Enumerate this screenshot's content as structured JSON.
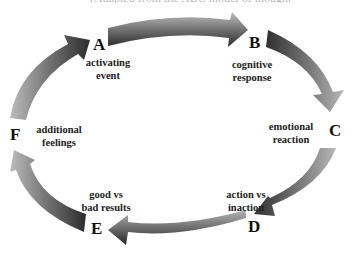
{
  "title": "(Adapted from the ABC model of thoughts and feelings)",
  "cycle": {
    "direction": "clockwise",
    "arrow_color_dark": "#2e2e2e",
    "arrow_color_light": "#a8a8a8",
    "nodes": [
      {
        "letter": "A",
        "line1": "activating",
        "line2": "event"
      },
      {
        "letter": "B",
        "line1": "cognitive",
        "line2": "response"
      },
      {
        "letter": "C",
        "line1": "emotional",
        "line2": "reaction"
      },
      {
        "letter": "D",
        "line1": "action vs",
        "line2": "inaction"
      },
      {
        "letter": "E",
        "line1": "good vs",
        "line2": "bad results"
      },
      {
        "letter": "F",
        "line1": "additional",
        "line2": "feelings"
      }
    ],
    "edges": [
      {
        "from": "A",
        "to": "B"
      },
      {
        "from": "B",
        "to": "C"
      },
      {
        "from": "C",
        "to": "D"
      },
      {
        "from": "D",
        "to": "E"
      },
      {
        "from": "E",
        "to": "F"
      },
      {
        "from": "F",
        "to": "A"
      }
    ]
  }
}
